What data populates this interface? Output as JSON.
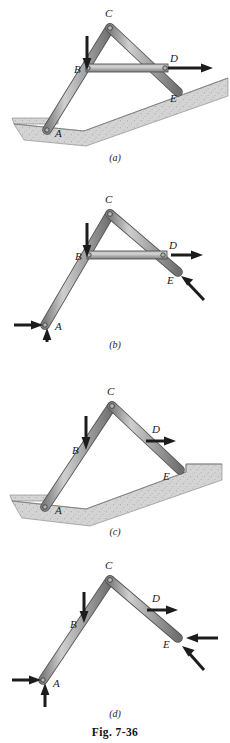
{
  "figure": {
    "number_label": "Fig. 7-36",
    "panels": [
      {
        "id": "a",
        "caption": "(a)",
        "description": "Frame ACE with horizontal member BD resting on ground at A and on sloped ground at E",
        "joint_labels": [
          "C",
          "B",
          "D",
          "A",
          "E"
        ],
        "labels": {
          "apex": "C",
          "left_mid": "B",
          "right_upper": "D",
          "left_base": "A",
          "right_base": "E"
        },
        "has_member_bd": true,
        "has_ground": true,
        "arrows": [
          {
            "name": "load-at-B",
            "direction": "down",
            "at": "B"
          },
          {
            "name": "load-at-D",
            "direction": "right",
            "at": "D"
          }
        ]
      },
      {
        "id": "b",
        "caption": "(b)",
        "description": "Free-body diagram of frame with member BD showing reactions at A and E",
        "joint_labels": [
          "C",
          "B",
          "D",
          "A",
          "E"
        ],
        "labels": {
          "apex": "C",
          "left_mid": "B",
          "right_upper": "D",
          "left_base": "A",
          "right_base": "E"
        },
        "has_member_bd": true,
        "has_ground": false,
        "arrows": [
          {
            "name": "load-at-B",
            "direction": "down",
            "at": "B"
          },
          {
            "name": "load-at-D",
            "direction": "right",
            "at": "D"
          },
          {
            "name": "reaction-at-A-horizontal",
            "direction": "right",
            "at": "A"
          },
          {
            "name": "reaction-at-A-vertical",
            "direction": "up",
            "at": "A"
          },
          {
            "name": "reaction-at-E-normal",
            "direction": "up-left-diagonal",
            "at": "E"
          }
        ]
      },
      {
        "id": "c",
        "caption": "(c)",
        "description": "Frame ACE without member BD resting on ground at A and on stepped ground at E",
        "joint_labels": [
          "C",
          "B",
          "D",
          "A",
          "E"
        ],
        "labels": {
          "apex": "C",
          "left_mid": "B",
          "right_upper": "D",
          "left_base": "A",
          "right_base": "E"
        },
        "has_member_bd": false,
        "has_ground": true,
        "arrows": [
          {
            "name": "load-at-B",
            "direction": "down",
            "at": "B"
          },
          {
            "name": "load-at-D",
            "direction": "right",
            "at": "D"
          }
        ]
      },
      {
        "id": "d",
        "caption": "(d)",
        "description": "Free-body diagram of two-bar frame without member BD showing reactions at A and E",
        "joint_labels": [
          "C",
          "B",
          "D",
          "A",
          "E"
        ],
        "labels": {
          "apex": "C",
          "left_mid": "B",
          "right_upper": "D",
          "left_base": "A",
          "right_base": "E"
        },
        "has_member_bd": false,
        "has_ground": false,
        "arrows": [
          {
            "name": "load-at-B",
            "direction": "down",
            "at": "B"
          },
          {
            "name": "load-at-D",
            "direction": "right",
            "at": "D"
          },
          {
            "name": "reaction-at-A-horizontal",
            "direction": "right",
            "at": "A"
          },
          {
            "name": "reaction-at-A-vertical",
            "direction": "up",
            "at": "A"
          },
          {
            "name": "reaction-at-E-horizontal",
            "direction": "left",
            "at": "E"
          },
          {
            "name": "reaction-at-E-normal",
            "direction": "up-left-diagonal",
            "at": "E"
          }
        ]
      }
    ]
  },
  "colors": {
    "member_fill": "#9b9b9b",
    "member_highlight": "#c9c9c9",
    "member_edge": "#555555",
    "ground_fill": "#d2d2d2",
    "ground_edge": "#8a8a8a",
    "arrow": "#1c1c1c",
    "text": "#1a1a1a",
    "background": "#ffffff"
  }
}
